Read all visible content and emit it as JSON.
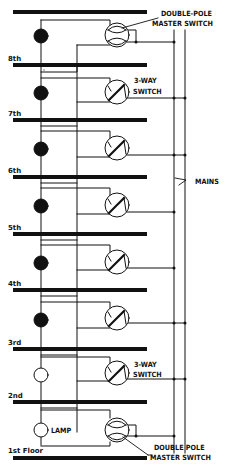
{
  "diagram": {
    "type": "wiring-diagram",
    "floors": [
      {
        "label": "8th",
        "lamp": "on"
      },
      {
        "label": "7th",
        "lamp": "on"
      },
      {
        "label": "6th",
        "lamp": "on"
      },
      {
        "label": "5th",
        "lamp": "on"
      },
      {
        "label": "4th",
        "lamp": "on"
      },
      {
        "label": "3rd",
        "lamp": "on"
      },
      {
        "label": "2nd",
        "lamp": "off"
      },
      {
        "label": "1st Floor",
        "lamp": "off"
      }
    ],
    "labels": {
      "top_switch_line1": "DOUBLE-POLE",
      "top_switch_line2": "MASTER SWITCH",
      "three_way_top_line1": "3-WAY",
      "three_way_top_line2": "SWITCH",
      "mains": "MAINS",
      "three_way_bottom_line1": "3-WAY",
      "three_way_bottom_line2": "SWITCH",
      "lamp": "LAMP",
      "bottom_switch_line1": "DOUBLE POLE",
      "bottom_switch_line2": "MASTER SWITCH"
    },
    "colors": {
      "ink": "#111111",
      "background": "#ffffff"
    }
  }
}
